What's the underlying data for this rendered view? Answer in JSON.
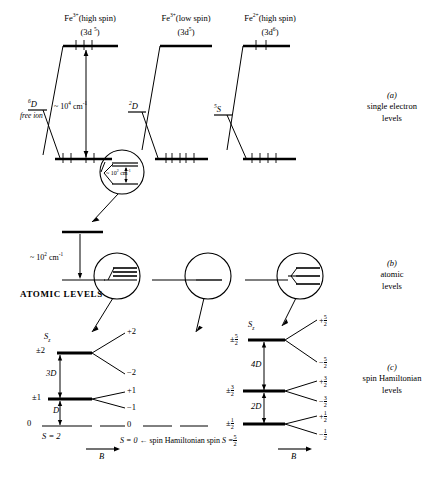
{
  "columns": [
    {
      "id": "fe3-high",
      "ion": "Fe",
      "charge": "3+",
      "spin_state": "(high  spin)",
      "config_base": "(3d",
      "config_exp": "5",
      "term": "6D"
    },
    {
      "id": "fe3-low",
      "ion": "Fe",
      "charge": "3+",
      "spin_state": "(low  spin)",
      "config_base": "(3d",
      "config_exp": "5",
      "term": "2D"
    },
    {
      "id": "fe2-high",
      "ion": "Fe",
      "charge": "2+",
      "spin_state": "(high spin)",
      "config_base": "(3d",
      "config_exp": "6",
      "term": "5S"
    }
  ],
  "headers": {
    "col1_ion": "Fe",
    "col1_charge": "3+",
    "col1_spin": "(high  spin)",
    "col1_config": "(3d",
    "col1_config_exp": "5",
    "col2_ion": "Fe",
    "col2_charge": "3+",
    "col2_spin": "(low  spin)",
    "col2_config": "(3d",
    "col2_config_exp": "5",
    "col3_ion": "Fe",
    "col3_charge": "2+",
    "col3_spin": "(high spin)",
    "col3_config": "(3d",
    "col3_config_exp": "6"
  },
  "panel_a": {
    "free_ion_label": "free ion",
    "term_col1_mult": "6",
    "term_col1_letter": "D",
    "term_col2_mult": "2",
    "term_col2_letter": "D",
    "term_col3_mult": "5",
    "term_col3_letter": "S",
    "energy_gap": "~ 10",
    "energy_gap_exp": "4",
    "energy_gap_unit": " cm",
    "energy_gap_unit_exp": "-1",
    "inset_gap": "~ 10",
    "inset_gap_exp": "2",
    "inset_gap_unit": " cm",
    "inset_gap_unit_exp": "-1",
    "section_letter": "(a)",
    "section_line1": "single electron",
    "section_line2": "levels"
  },
  "panel_b": {
    "energy_gap": "~ 10",
    "energy_gap_exp": "2",
    "energy_gap_unit": " cm",
    "energy_gap_unit_exp": "-1",
    "atomic_levels_label": "ATOMIC LEVELS",
    "section_letter": "(b)",
    "section_line1": "atomic",
    "section_line2": "levels"
  },
  "panel_c": {
    "section_letter": "(c)",
    "section_line1": "spin Hamiltonian",
    "section_line2": "levels",
    "left": {
      "sz_symbol": "S",
      "sz_sub": "z",
      "levels": [
        {
          "label": "±2",
          "split": [
            "+2",
            "−2"
          ]
        },
        {
          "label": "±1",
          "split": [
            "+1",
            "−1"
          ]
        },
        {
          "label": "0",
          "split": [
            "0"
          ]
        }
      ],
      "gaps": [
        "3D",
        "D"
      ],
      "spin_value": "S = 2",
      "field_axis": "B"
    },
    "middle": {
      "spin_value": "S = 0"
    },
    "right": {
      "sz_symbol": "S",
      "sz_sub": "z",
      "levels": [
        {
          "num": "5",
          "den": "2",
          "split_plus_num": "5",
          "split_plus_den": "2",
          "split_minus_num": "5",
          "split_minus_den": "2"
        },
        {
          "num": "3",
          "den": "2",
          "split_plus_num": "3",
          "split_plus_den": "2",
          "split_minus_num": "3",
          "split_minus_den": "2"
        },
        {
          "num": "1",
          "den": "2",
          "split_plus_num": "1",
          "split_plus_den": "2",
          "split_minus_num": "1",
          "split_minus_den": "2"
        }
      ],
      "gaps": [
        "4D",
        "2D"
      ],
      "field_axis": "B"
    },
    "bottom_caption_left": "S = 0",
    "bottom_caption_arrow": "←",
    "bottom_caption_text": "spin Hamiltonian spin",
    "bottom_caption_right": "S =",
    "bottom_caption_right_num": "5",
    "bottom_caption_right_den": "2"
  },
  "colors": {
    "ink": "#000000",
    "background": "#ffffff"
  }
}
